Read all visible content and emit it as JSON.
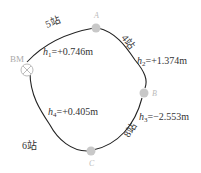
{
  "diagram": {
    "type": "closed-leveling-route",
    "benchmark": {
      "label": "BM"
    },
    "points": [
      {
        "id": "A",
        "label": "A"
      },
      {
        "id": "B",
        "label": "B"
      },
      {
        "id": "C",
        "label": "C"
      }
    ],
    "segments": [
      {
        "from": "BM",
        "to": "A",
        "stations": "5站",
        "h_var": "h",
        "h_sub": "1",
        "h_value": "=+0.746m"
      },
      {
        "from": "A",
        "to": "B",
        "stations": "4站",
        "h_var": "h",
        "h_sub": "2",
        "h_value": "=+1.374m"
      },
      {
        "from": "B",
        "to": "C",
        "stations": "8站",
        "h_var": "h",
        "h_sub": "3",
        "h_value": "=−2.553m"
      },
      {
        "from": "C",
        "to": "BM",
        "stations": "6站",
        "h_var": "h",
        "h_sub": "4",
        "h_value": "=+0.405m"
      }
    ],
    "colors": {
      "line": "#222222",
      "point": "#c8c8c8",
      "text": "#333333"
    }
  }
}
